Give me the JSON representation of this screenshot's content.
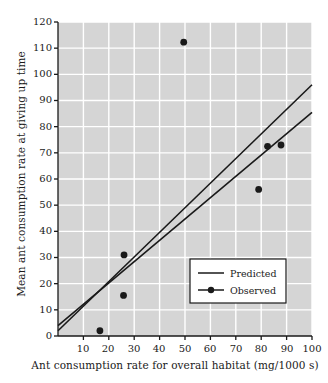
{
  "chart_data": {
    "type": "scatter",
    "title": "",
    "xlabel": "Ant consumption rate for overall habitat (mg/1000 s)",
    "ylabel": "Mean ant consumption rate at giving up time",
    "xlim": [
      0,
      100
    ],
    "ylim": [
      0,
      120
    ],
    "xticks": [
      10,
      20,
      30,
      40,
      50,
      60,
      70,
      80,
      90,
      100
    ],
    "yticks": [
      0,
      10,
      20,
      30,
      40,
      50,
      60,
      70,
      80,
      90,
      100,
      110,
      120
    ],
    "grid": true,
    "legend_position": "center-right",
    "background_color": "#d5d5d5",
    "gridline_color": "#ffffff",
    "ink_color": "#1a1a1a",
    "series": [
      {
        "name": "Observed",
        "type": "scatter",
        "marker": "filled-circle",
        "points": [
          {
            "x": 16.5,
            "y": 2.0
          },
          {
            "x": 25.8,
            "y": 15.5
          },
          {
            "x": 26.0,
            "y": 31.0
          },
          {
            "x": 49.5,
            "y": 112.3
          },
          {
            "x": 79.0,
            "y": 56.0
          },
          {
            "x": 82.5,
            "y": 72.5
          },
          {
            "x": 87.8,
            "y": 73.0
          }
        ]
      },
      {
        "name": "Predicted",
        "type": "line",
        "line_upper": {
          "x1": 0,
          "y1": 2.0,
          "x2": 100,
          "y2": 96.0
        },
        "line_lower": {
          "x1": 0,
          "y1": 4.0,
          "x2": 100,
          "y2": 85.5
        }
      }
    ],
    "legend": [
      {
        "label": "Predicted",
        "marker": "line"
      },
      {
        "label": "Observed",
        "marker": "line-with-dot"
      }
    ]
  }
}
